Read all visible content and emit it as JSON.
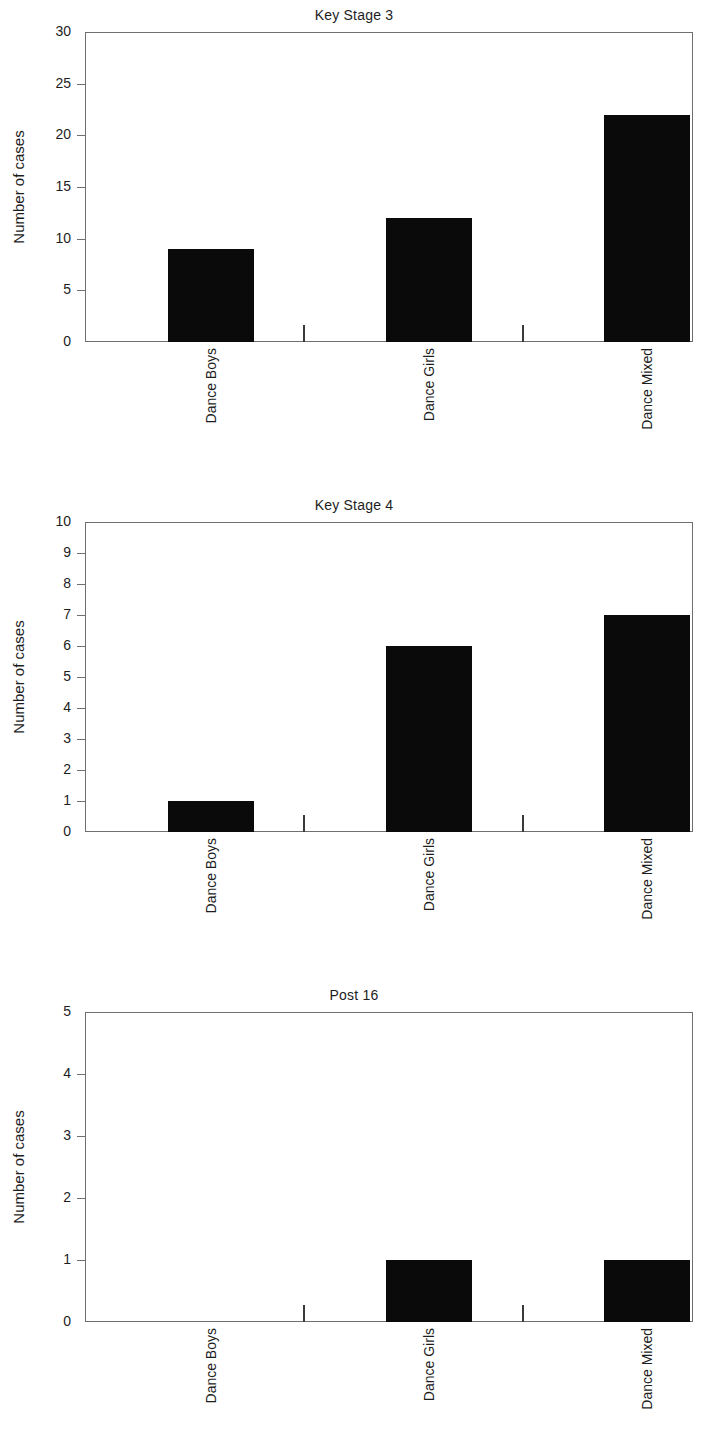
{
  "figure": {
    "background": "#ffffff",
    "bar_color": "#0a0a0a",
    "axis_color": "#6f6f6f",
    "text_color": "#1d1d1d"
  },
  "chart_data": [
    {
      "type": "bar",
      "title": "Key Stage 3",
      "xlabel": "",
      "ylabel": "Number of cases",
      "categories": [
        "Dance Boys",
        "Dance Girls",
        "Dance Mixed"
      ],
      "values": [
        9,
        12,
        22
      ],
      "ylim": [
        0,
        30
      ],
      "ytick_step": 5,
      "yticks": [
        0,
        5,
        10,
        15,
        20,
        25,
        30
      ],
      "ytick_labels": [
        "0",
        "5",
        "10",
        "15",
        "20",
        "25",
        "30"
      ],
      "grid": false,
      "legend": false
    },
    {
      "type": "bar",
      "title": "Key Stage 4",
      "xlabel": "",
      "ylabel": "Number of cases",
      "categories": [
        "Dance Boys",
        "Dance Girls",
        "Dance Mixed"
      ],
      "values": [
        1,
        6,
        7
      ],
      "ylim": [
        0,
        10
      ],
      "ytick_step": 1,
      "yticks": [
        0,
        1,
        2,
        3,
        4,
        5,
        6,
        7,
        8,
        9,
        10
      ],
      "ytick_labels": [
        "0",
        "1",
        "2",
        "3",
        "4",
        "5",
        "6",
        "7",
        "8",
        "9",
        "10"
      ],
      "grid": false,
      "legend": false
    },
    {
      "type": "bar",
      "title": "Post 16",
      "xlabel": "",
      "ylabel": "Number of cases",
      "categories": [
        "Dance Boys",
        "Dance Girls",
        "Dance Mixed"
      ],
      "values": [
        0,
        1,
        1
      ],
      "ylim": [
        0,
        5
      ],
      "ytick_step": 1,
      "yticks": [
        0,
        1,
        2,
        3,
        4,
        5
      ],
      "ytick_labels": [
        "0",
        "1",
        "2",
        "3",
        "4",
        "5"
      ],
      "grid": false,
      "legend": false
    }
  ]
}
